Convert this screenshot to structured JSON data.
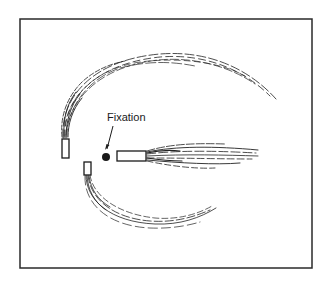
{
  "figure": {
    "label": "Fixation",
    "colors": {
      "ink": "#1a1a1a",
      "background": "#ffffff",
      "frame": "#2a2a2a"
    },
    "frame": {
      "x": 20,
      "y": 19,
      "width": 292,
      "height": 249
    },
    "fixation_point": {
      "cx": 106,
      "cy": 157,
      "r": 4
    },
    "bars": [
      {
        "id": "left-vertical-bar",
        "x": 62,
        "y": 139,
        "width": 7,
        "height": 19
      },
      {
        "id": "lower-vertical-bar",
        "x": 84,
        "y": 162,
        "width": 7,
        "height": 13
      },
      {
        "id": "right-horizontal-bar",
        "x": 117,
        "y": 151,
        "width": 29,
        "height": 10
      }
    ],
    "trails": [
      {
        "id": "upper-arc-trail",
        "from": "left-vertical-bar",
        "shape": "arc over top curving right"
      },
      {
        "id": "lower-arc-trail",
        "from": "lower-vertical-bar",
        "shape": "arc under bottom curving right"
      },
      {
        "id": "horizontal-fan-trail",
        "from": "right-horizontal-bar",
        "shape": "fan extending right"
      }
    ]
  }
}
